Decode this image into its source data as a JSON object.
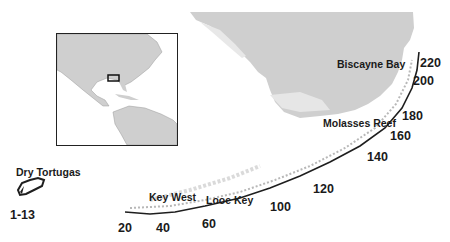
{
  "map": {
    "title": "Florida Keys reef tract sampling sites",
    "colors": {
      "land": "#cfcfcf",
      "reef": "#1e1e1e",
      "water": "#ffffff",
      "text": "#1a1a1a"
    },
    "place_labels": [
      {
        "id": "dry-tortugas",
        "text": "Dry Tortugas",
        "x": 16,
        "y": 167
      },
      {
        "id": "key-west",
        "text": "Key West",
        "x": 149,
        "y": 192
      },
      {
        "id": "looe-key",
        "text": "Looe Key",
        "x": 206,
        "y": 195
      },
      {
        "id": "molasses-reef",
        "text": "Molasses Reef",
        "x": 323,
        "y": 118
      },
      {
        "id": "biscayne-bay",
        "text": "Biscayne Bay",
        "x": 337,
        "y": 59
      }
    ],
    "distance_labels": [
      {
        "text": "1-13",
        "x": 10,
        "y": 209
      },
      {
        "text": "20",
        "x": 118,
        "y": 222
      },
      {
        "text": "40",
        "x": 156,
        "y": 222
      },
      {
        "text": "60",
        "x": 202,
        "y": 218
      },
      {
        "text": "100",
        "x": 270,
        "y": 201
      },
      {
        "text": "120",
        "x": 313,
        "y": 183
      },
      {
        "text": "140",
        "x": 367,
        "y": 151
      },
      {
        "text": "160",
        "x": 390,
        "y": 130
      },
      {
        "text": "180",
        "x": 402,
        "y": 110
      },
      {
        "text": "200",
        "x": 413,
        "y": 75
      },
      {
        "text": "220",
        "x": 420,
        "y": 57
      }
    ],
    "inset": {
      "description": "Locator map of North America, Caribbean and northern South America",
      "highlight_box": "Florida Keys region"
    }
  }
}
